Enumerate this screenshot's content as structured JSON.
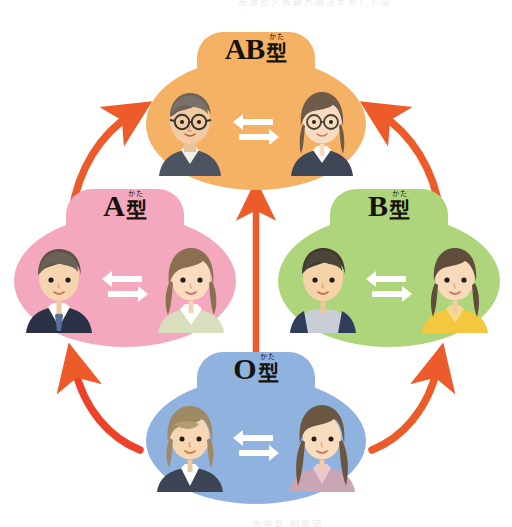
{
  "page": {
    "background_color": "#ffffff",
    "caption_top": "血液型と性格の関連を示した図",
    "caption_bottom": "血液型 相関図"
  },
  "diagram": {
    "type": "cycle-diagram",
    "arrow_color": "#ED5B2A",
    "exchange_glyph": "exchange-double-arrow",
    "nodes": [
      {
        "id": "ab",
        "latin": "AB",
        "kanji": "型",
        "furigana": "かた",
        "full_label": "AB型",
        "bubble_color": "#F5B164",
        "position": "top",
        "people": [
          {
            "role": "man",
            "glasses": true,
            "hair_color": "#6E655A",
            "clothing_color": "#4B5460",
            "shirt_color": "#F2EFE6"
          },
          {
            "role": "woman",
            "glasses": true,
            "hair_color": "#6E5B4A",
            "clothing_color": "#3E4656",
            "shirt_color": "#FFFFFF"
          }
        ]
      },
      {
        "id": "a",
        "latin": "A",
        "kanji": "型",
        "furigana": "かた",
        "full_label": "A型",
        "bubble_color": "#F4A8BE",
        "position": "left",
        "people": [
          {
            "role": "man",
            "glasses": false,
            "hair_color": "#5E5347",
            "clothing_color": "#2B3245",
            "shirt_color": "#FFFFFF",
            "tie_color": "#566F9B"
          },
          {
            "role": "woman",
            "glasses": false,
            "hair_color": "#8A6F51",
            "clothing_color": "#D9DEBE",
            "shirt_color": "#FFFFFF"
          }
        ]
      },
      {
        "id": "b",
        "latin": "B",
        "kanji": "型",
        "furigana": "かた",
        "full_label": "B型",
        "bubble_color": "#AFD57C",
        "position": "right",
        "people": [
          {
            "role": "man",
            "glasses": false,
            "hair_color": "#413A33",
            "clothing_color": "#2F3C5A",
            "shirt_color": "#C9CED6"
          },
          {
            "role": "woman",
            "glasses": false,
            "hair_color": "#5F4C3C",
            "clothing_color": "#F3C73F",
            "shirt_color": "#F6D98B"
          }
        ]
      },
      {
        "id": "o",
        "latin": "O",
        "kanji": "型",
        "furigana": "かた",
        "full_label": "O型",
        "bubble_color": "#8FB2DF",
        "position": "bottom",
        "people": [
          {
            "role": "man",
            "glasses": false,
            "hair_color": "#A08A64",
            "clothing_color": "#3C4455",
            "shirt_color": "#FFFFFF"
          },
          {
            "role": "woman",
            "glasses": false,
            "hair_color": "#6B5642",
            "clothing_color": "#C9A5B5",
            "shirt_color": "#E8C9CF"
          }
        ]
      }
    ],
    "arrows": [
      {
        "id": "a-to-ab",
        "from": "A型",
        "to": "AB型",
        "shape": "curved",
        "direction": "up-right"
      },
      {
        "id": "b-to-ab",
        "from": "B型",
        "to": "AB型",
        "shape": "curved",
        "direction": "up-left"
      },
      {
        "id": "o-to-a",
        "from": "O型",
        "to": "A型",
        "shape": "curved",
        "direction": "up-left"
      },
      {
        "id": "o-to-b",
        "from": "O型",
        "to": "B型",
        "shape": "curved",
        "direction": "up-right"
      },
      {
        "id": "o-to-ab",
        "from": "O型",
        "to": "AB型",
        "shape": "straight",
        "direction": "up"
      }
    ]
  }
}
